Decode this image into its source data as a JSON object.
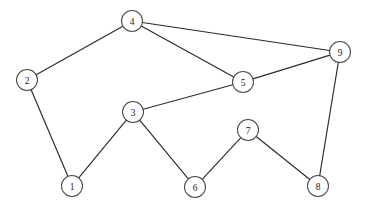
{
  "diagram": {
    "type": "node-link-graph",
    "background_color": "#ffffff",
    "edge_color": "#2b2b2b",
    "node_fill_color": "#ffffff",
    "node_stroke_color": "#4a4a4a",
    "label_color": "#1a1a1a",
    "node_radius": 10.5,
    "canvas": {
      "width": 367,
      "height": 206
    },
    "nodes": [
      {
        "id": "1",
        "label": "1",
        "x": 72,
        "y": 186
      },
      {
        "id": "2",
        "label": "2",
        "x": 27,
        "y": 80
      },
      {
        "id": "3",
        "label": "3",
        "x": 133,
        "y": 112
      },
      {
        "id": "4",
        "label": "4",
        "x": 132,
        "y": 21
      },
      {
        "id": "5",
        "label": "5",
        "x": 243,
        "y": 82
      },
      {
        "id": "6",
        "label": "6",
        "x": 195,
        "y": 187
      },
      {
        "id": "7",
        "label": "7",
        "x": 248,
        "y": 130
      },
      {
        "id": "8",
        "label": "8",
        "x": 318,
        "y": 186
      },
      {
        "id": "9",
        "label": "9",
        "x": 340,
        "y": 52
      }
    ],
    "edges": [
      {
        "source": "1",
        "target": "2"
      },
      {
        "source": "1",
        "target": "3"
      },
      {
        "source": "2",
        "target": "4"
      },
      {
        "source": "3",
        "target": "5"
      },
      {
        "source": "3",
        "target": "6"
      },
      {
        "source": "4",
        "target": "5"
      },
      {
        "source": "4",
        "target": "9"
      },
      {
        "source": "5",
        "target": "9"
      },
      {
        "source": "6",
        "target": "7"
      },
      {
        "source": "7",
        "target": "8"
      },
      {
        "source": "8",
        "target": "9"
      }
    ]
  }
}
